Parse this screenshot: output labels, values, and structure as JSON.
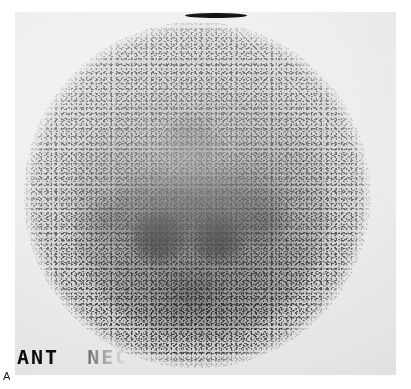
{
  "figure": {
    "panel_label": "A",
    "modality": "thyroid-scintigram",
    "view": "anterior-neck"
  },
  "film": {
    "annotation_visible": "ANT",
    "annotation_fading": "NEC",
    "annotation_full": "ANT NEC",
    "marker": "fiducial-bar"
  },
  "colors": {
    "page_background": "#ffffff",
    "film_base": "#efefed",
    "counts_dark": "#0d0d0d",
    "marker_bar": "#141414"
  },
  "scan": {
    "field_of_view": "circular",
    "uptake_pattern": "diffuse-with-bilateral-focal-hotspots",
    "hotspots": [
      {
        "name": "left-lobe",
        "cx_pct": 39,
        "cy_pct": 62,
        "intensity": 0.8
      },
      {
        "name": "right-lobe",
        "cx_pct": 56,
        "cy_pct": 62,
        "intensity": 0.78
      },
      {
        "name": "isthmus",
        "cx_pct": 48,
        "cy_pct": 53,
        "intensity": 0.62
      }
    ]
  }
}
